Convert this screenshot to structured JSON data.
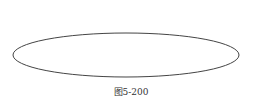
{
  "figure": {
    "caption": "图5-200",
    "ellipse": {
      "cx": 126,
      "cy": 55,
      "rx": 113,
      "ry": 22,
      "stroke": "#444444",
      "stroke_width": 1
    }
  }
}
